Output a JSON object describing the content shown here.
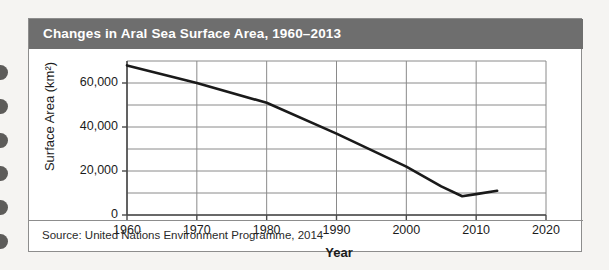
{
  "figure": {
    "title": "Changes in Aral Sea Surface Area, 1960–2013",
    "source": "Source: United Nations Environment Programme, 2014",
    "title_bar_color": "#6e6e6e",
    "title_text_color": "#ffffff",
    "card_background": "#ffffff",
    "page_background": "#f5f4f2",
    "border_color": "#8d8d8d",
    "line_color": "#1a1a1a",
    "grid_color": "#8a8a8a",
    "binding_hole_color": "#5d5c5a"
  },
  "chart_data": {
    "type": "line",
    "title": "Changes in Aral Sea Surface Area, 1960–2013",
    "xlabel": "Year",
    "ylabel": "Surface Area (km²)",
    "xlim": [
      1960,
      2020
    ],
    "ylim": [
      0,
      70000
    ],
    "xticks": [
      1960,
      1970,
      1980,
      1990,
      2000,
      2010,
      2020
    ],
    "xtick_labels": [
      "1960",
      "1970",
      "1980",
      "1990",
      "2000",
      "2010",
      "2020"
    ],
    "yticks": [
      0,
      20000,
      40000,
      60000
    ],
    "ytick_labels": [
      "0",
      "20,000",
      "40,000",
      "60,000"
    ],
    "y_gridlines": [
      0,
      10000,
      20000,
      30000,
      40000,
      50000,
      60000,
      70000
    ],
    "x_gridlines": [
      1960,
      1970,
      1980,
      1990,
      2000,
      2010,
      2020
    ],
    "grid": true,
    "legend": false,
    "series": [
      {
        "name": "Aral Sea surface area",
        "x": [
          1960,
          1970,
          1980,
          1990,
          2000,
          2005,
          2008,
          2010,
          2013
        ],
        "values": [
          68000,
          60000,
          51000,
          37000,
          22000,
          13000,
          8500,
          9500,
          11000
        ]
      }
    ]
  },
  "binding": {
    "holes": [
      65,
      99,
      133,
      166,
      200,
      234
    ]
  }
}
